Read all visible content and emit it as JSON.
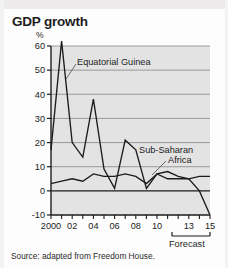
{
  "title": "GDP growth",
  "source": "Source: adapted from Freedom House.",
  "axis_unit": "%",
  "forecast_label": "Forecast",
  "labels": {
    "series1": "Equatorial Guinea",
    "series2_line1": "Sub-Saharan",
    "series2_line2": "Africa"
  },
  "colors": {
    "plot_background": "#e3e3e3",
    "line": "#1c1c1c",
    "gridline": "#8d8d8d",
    "page_background": "#fdfdfd"
  },
  "y_ticks": [
    "60",
    "50",
    "40",
    "30",
    "20",
    "10",
    "0",
    "-10"
  ],
  "x_ticks": [
    "2000",
    "02",
    "04",
    "06",
    "08",
    "10",
    "13",
    "15"
  ],
  "chart_data": {
    "type": "line",
    "title": "GDP growth",
    "xlabel": "",
    "ylabel": "%",
    "ylim": [
      -10,
      60
    ],
    "xlim": [
      2000,
      2015
    ],
    "grid": true,
    "legend": "annotated-inline",
    "x": [
      2000,
      2001,
      2002,
      2003,
      2004,
      2005,
      2006,
      2007,
      2008,
      2009,
      2010,
      2011,
      2012,
      2013,
      2014,
      2015
    ],
    "series": [
      {
        "name": "Equatorial Guinea",
        "values": [
          17,
          62,
          20,
          14,
          38,
          9,
          1,
          21,
          17,
          1,
          7,
          8,
          6,
          5,
          0,
          -10
        ]
      },
      {
        "name": "Sub-Saharan Africa",
        "values": [
          3,
          4,
          5,
          4,
          7,
          6,
          6,
          7,
          6,
          3,
          7,
          5,
          5,
          5,
          6,
          6
        ]
      }
    ],
    "annotations": [
      {
        "text": "Equatorial Guinea",
        "points_to_series": "Equatorial Guinea"
      },
      {
        "text": "Sub-Saharan Africa",
        "points_to_series": "Sub-Saharan Africa"
      },
      {
        "text": "Forecast",
        "x_range": [
          2013,
          2015
        ]
      }
    ]
  }
}
